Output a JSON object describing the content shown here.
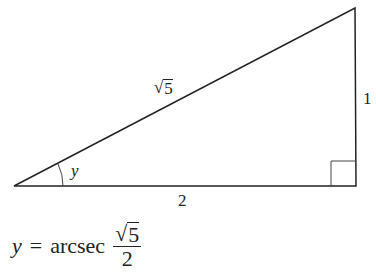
{
  "diagram": {
    "type": "right-triangle",
    "labels": {
      "hypotenuse": "5",
      "adjacent": "2",
      "opposite": "1",
      "angle": "y"
    },
    "right_angle_marker": true
  },
  "formula": {
    "lhs": "y",
    "equals": "=",
    "function": "arcsec",
    "numerator_radicand": "5",
    "denominator": "2"
  }
}
